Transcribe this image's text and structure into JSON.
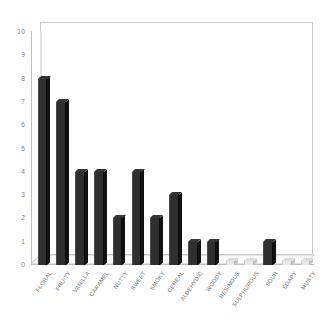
{
  "chart_data": {
    "type": "bar",
    "title": "",
    "subtitle": "",
    "xlabel": "",
    "ylabel": "",
    "ylim": [
      0,
      10
    ],
    "ytick_labels": [
      "10",
      "9",
      "8",
      "7",
      "6",
      "5",
      "4",
      "3",
      "2",
      "1",
      "0"
    ],
    "ytick_values": [
      10,
      9,
      8,
      7,
      6,
      5,
      4,
      3,
      2,
      1,
      0
    ],
    "grid": false,
    "legend": "none",
    "three_d": true,
    "bar_color": "#2f2f2f",
    "background_color": "#ffffff",
    "axis_color": "#bfbfbf",
    "tick_text_color": "#6f6f6f",
    "categories": [
      "FLORAL",
      "FRUITY",
      "VANILLA",
      "CARAMEL",
      "NUTTY",
      "SWEET",
      "SMOKY",
      "CEREAL",
      "ALDEHYDIC",
      "WOODY",
      "RESINOUS",
      "SULPHUROUS",
      "SOUR",
      "SOAPY",
      "MUSTY"
    ],
    "values": [
      8,
      7,
      4,
      4,
      2,
      4,
      2,
      3,
      1,
      1,
      0,
      0,
      1,
      0,
      0
    ]
  }
}
